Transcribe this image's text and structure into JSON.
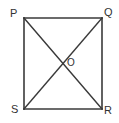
{
  "figure": {
    "shape_type": "rectangle-with-diagonals",
    "background_color": "#ffffff",
    "stroke_color": "#3a3a3a",
    "label_color": "#323232",
    "stroke_width": 1.6,
    "canvas": {
      "width": 119,
      "height": 123
    },
    "rect": {
      "left": 24,
      "top": 18,
      "right": 102,
      "bottom": 109
    },
    "vertices": [
      {
        "id": "P",
        "label": "P",
        "x": 24,
        "y": 18,
        "corner": "top-left"
      },
      {
        "id": "Q",
        "label": "Q",
        "x": 102,
        "y": 18,
        "corner": "top-right"
      },
      {
        "id": "R",
        "label": "R",
        "x": 102,
        "y": 109,
        "corner": "bottom-right"
      },
      {
        "id": "S",
        "label": "S",
        "x": 24,
        "y": 109,
        "corner": "bottom-left"
      }
    ],
    "center": {
      "id": "O",
      "label": "O",
      "x": 63,
      "y": 63
    },
    "sides": [
      {
        "name": "PQ",
        "x1": 24,
        "y1": 18,
        "x2": 102,
        "y2": 18
      },
      {
        "name": "QR",
        "x1": 102,
        "y1": 18,
        "x2": 102,
        "y2": 109
      },
      {
        "name": "RS",
        "x1": 102,
        "y1": 109,
        "x2": 24,
        "y2": 109
      },
      {
        "name": "SP",
        "x1": 24,
        "y1": 109,
        "x2": 24,
        "y2": 18
      }
    ],
    "diagonals": [
      {
        "name": "PR",
        "x1": 24,
        "y1": 18,
        "x2": 102,
        "y2": 109
      },
      {
        "name": "QS",
        "x1": 102,
        "y1": 18,
        "x2": 24,
        "y2": 109
      }
    ]
  }
}
